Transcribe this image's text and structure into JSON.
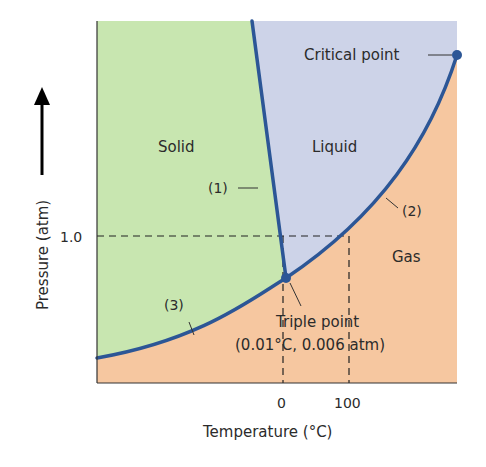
{
  "regions": {
    "solid": "Solid",
    "liquid": "Liquid",
    "gas": "Gas"
  },
  "curves": {
    "fusion": "(1)",
    "vaporization": "(2)",
    "sublimation": "(3)"
  },
  "points": {
    "critical": "Critical point",
    "triple": "Triple point",
    "triple_coords": "(0.01°C, 0.006 atm)"
  },
  "axes": {
    "y_label": "Pressure (atm)",
    "y_tick": "1.0",
    "x_label": "Temperature (°C)",
    "x_ticks": [
      "0",
      "100"
    ]
  },
  "colors": {
    "solid": "#c8e6b0",
    "liquid": "#cdd3e8",
    "gas": "#f6c7a0",
    "curve": "#2c5696"
  }
}
